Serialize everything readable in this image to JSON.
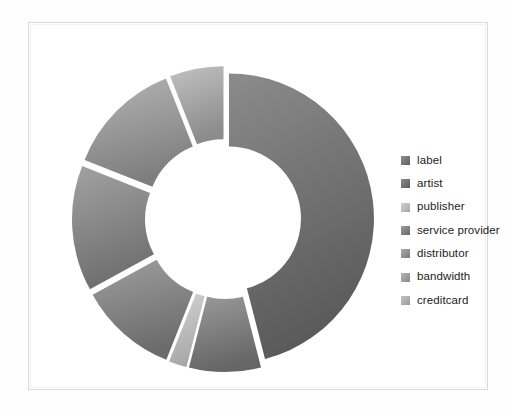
{
  "page": {
    "background": "#ffffff",
    "frame_color": "#d9d9d9"
  },
  "legend": {
    "position": "right",
    "items": [
      {
        "label": "label",
        "color": "#6e6e6e",
        "swatch_from": "#8f8f8f",
        "swatch_to": "#5e5e5e"
      },
      {
        "label": "artist",
        "color": "#6b6b6b",
        "swatch_from": "#8c8c8c",
        "swatch_to": "#5b5b5b"
      },
      {
        "label": "publisher",
        "color": "#b9b9b9",
        "swatch_from": "#d2d2d2",
        "swatch_to": "#a6a6a6"
      },
      {
        "label": "service provider",
        "color": "#7a7a7a",
        "swatch_from": "#9b9b9b",
        "swatch_to": "#6a6a6a"
      },
      {
        "label": "distributor",
        "color": "#8c8c8c",
        "swatch_from": "#ababab",
        "swatch_to": "#7b7b7b"
      },
      {
        "label": "bandwidth",
        "color": "#9a9a9a",
        "swatch_from": "#b6b6b6",
        "swatch_to": "#8a8a8a"
      },
      {
        "label": "creditcard",
        "color": "#a9a9a9",
        "swatch_from": "#c4c4c4",
        "swatch_to": "#999999"
      }
    ]
  },
  "chart_data": {
    "type": "pie",
    "variant": "exploded-doughnut",
    "title": "",
    "xlabel": "",
    "ylabel": "",
    "grid": false,
    "legend_position": "right",
    "center": {
      "x": 166,
      "y": 172
    },
    "outer_radius": 145,
    "inner_radius": 72,
    "explode_offset": 6,
    "start_angle_deg": -90,
    "direction": "clockwise",
    "labels": [
      "label",
      "artist",
      "publisher",
      "service provider",
      "distributor",
      "bandwidth",
      "creditcard"
    ],
    "values": [
      46,
      8,
      2,
      11,
      14,
      13,
      6
    ],
    "units": "percent",
    "slices": [
      {
        "name": "label",
        "value": 46,
        "start_deg": -90,
        "sweep_deg": 165.6,
        "fill_from": "#8b8b8b",
        "fill_to": "#5a5a5a",
        "explode": 4
      },
      {
        "name": "artist",
        "value": 8,
        "start_deg": 75.6,
        "sweep_deg": 28.8,
        "fill_from": "#9a9a9a",
        "fill_to": "#666666",
        "explode": 8
      },
      {
        "name": "publisher",
        "value": 2,
        "start_deg": 104.4,
        "sweep_deg": 7.2,
        "fill_from": "#d4d4d4",
        "fill_to": "#a8a8a8",
        "explode": 8
      },
      {
        "name": "service provider",
        "value": 11,
        "start_deg": 111.6,
        "sweep_deg": 39.6,
        "fill_from": "#9e9e9e",
        "fill_to": "#6b6b6b",
        "explode": 8
      },
      {
        "name": "distributor",
        "value": 14,
        "start_deg": 151.2,
        "sweep_deg": 50.4,
        "fill_from": "#a2a2a2",
        "fill_to": "#6f6f6f",
        "explode": 8
      },
      {
        "name": "bandwidth",
        "value": 13,
        "start_deg": 201.6,
        "sweep_deg": 46.8,
        "fill_from": "#b4b4b4",
        "fill_to": "#7e7e7e",
        "explode": 8
      },
      {
        "name": "creditcard",
        "value": 6,
        "start_deg": 248.4,
        "sweep_deg": 21.6,
        "fill_from": "#c2c2c2",
        "fill_to": "#8c8c8c",
        "explode": 8
      }
    ]
  }
}
